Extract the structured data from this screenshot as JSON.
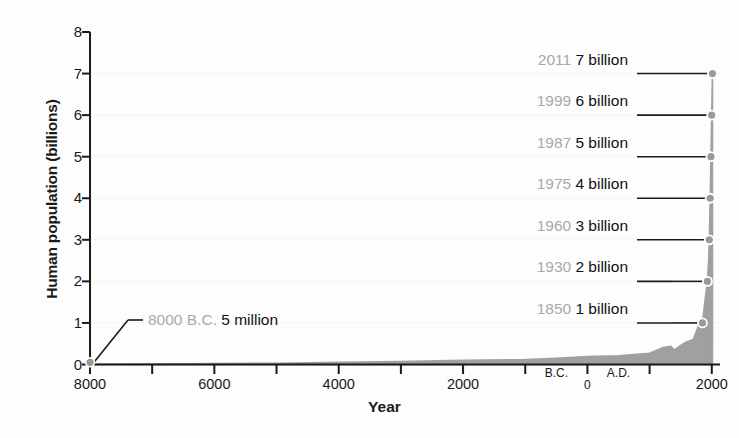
{
  "chart_data": {
    "type": "area",
    "title": "",
    "xlabel": "Year",
    "ylabel": "Human population (billions)",
    "xlim": [
      -8000,
      2100
    ],
    "ylim": [
      0,
      8
    ],
    "grid": true,
    "legend": "none",
    "y_ticks": [
      "0",
      "1",
      "2",
      "3",
      "4",
      "5",
      "6",
      "7",
      "8"
    ],
    "y_tick_values": [
      0,
      1,
      2,
      3,
      4,
      5,
      6,
      7,
      8
    ],
    "x_ticks": [
      {
        "label": "8000",
        "value": -8000
      },
      {
        "label": "",
        "value": -7000
      },
      {
        "label": "6000",
        "value": -6000
      },
      {
        "label": "",
        "value": -5000
      },
      {
        "label": "4000",
        "value": -4000
      },
      {
        "label": "",
        "value": -3000
      },
      {
        "label": "2000",
        "value": -2000
      },
      {
        "label": "",
        "value": -1000
      },
      {
        "label": "0",
        "value": 0
      },
      {
        "label": "",
        "value": 1000
      },
      {
        "label": "2000",
        "value": 2000
      }
    ],
    "era_labels": [
      {
        "label": "B.C.",
        "value": -500
      },
      {
        "label": "A.D.",
        "value": 500
      }
    ],
    "series_name": "Human population",
    "x": [
      -8000,
      -7000,
      -6000,
      -5000,
      -4000,
      -3000,
      -2000,
      -1000,
      -500,
      0,
      500,
      1000,
      1200,
      1340,
      1400,
      1500,
      1600,
      1700,
      1750,
      1800,
      1850,
      1900,
      1930,
      1950,
      1960,
      1975,
      1987,
      1999,
      2011
    ],
    "values": [
      0.005,
      0.01,
      0.02,
      0.03,
      0.05,
      0.07,
      0.1,
      0.12,
      0.15,
      0.19,
      0.21,
      0.27,
      0.4,
      0.44,
      0.35,
      0.46,
      0.55,
      0.6,
      0.79,
      0.98,
      1.0,
      1.65,
      2.0,
      2.5,
      3.0,
      4.0,
      5.0,
      6.0,
      7.0
    ],
    "annotations": [
      {
        "year": "2011",
        "value": "7 billion",
        "y": 7,
        "x": 2011
      },
      {
        "year": "1999",
        "value": "6 billion",
        "y": 6,
        "x": 1999
      },
      {
        "year": "1987",
        "value": "5 billion",
        "y": 5,
        "x": 1987
      },
      {
        "year": "1975",
        "value": "4 billion",
        "y": 4,
        "x": 1975
      },
      {
        "year": "1960",
        "value": "3 billion",
        "y": 3,
        "x": 1960
      },
      {
        "year": "1930",
        "value": "2 billion",
        "y": 2,
        "x": 1930
      },
      {
        "year": "1850",
        "value": "1 billion",
        "y": 1,
        "x": 1850
      }
    ],
    "annotation_left": {
      "year": "8000 B.C.",
      "value": "5 million",
      "y": 0.005,
      "x": -8000
    },
    "colors": {
      "area_fill": "#a0a0a0",
      "axis": "#1a1a1a",
      "gridline": "#e8e8e8",
      "annotation_year": "#a9a9a9",
      "annotation_value": "#111111",
      "marker": "#9a9a9a",
      "background": "#fdfdfd"
    }
  }
}
